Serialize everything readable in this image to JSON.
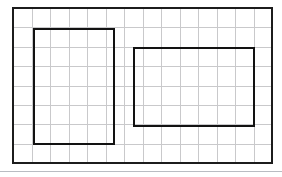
{
  "figure": {
    "background_color": "#ffffff"
  },
  "chart_data": {
    "type": "diagram",
    "subtitle": "",
    "xlabel": "",
    "ylabel": "",
    "grid": true,
    "legend": null,
    "annotations": [],
    "grid_spec": {
      "columns": 14,
      "rows": 8,
      "origin_x_px": 13,
      "origin_y_px": 8,
      "width_px": 259,
      "height_px": 155,
      "cell_width_px": 18.5,
      "cell_height_px": 19.375,
      "minor_line_color": "#c9c9cb",
      "minor_line_width_px": 1,
      "frame_color": "#1c1c1c",
      "frame_line_width_px": 2
    },
    "shapes": [
      {
        "name": "left-rectangle",
        "type": "rectangle",
        "stroke_color": "#121212",
        "stroke_width_px": 2.4,
        "fill": "none",
        "x_px": 34,
        "y_px": 29,
        "width_px": 80,
        "height_px": 115,
        "grid_col_start": 1,
        "grid_col_end": 5,
        "grid_row_start": 1,
        "grid_row_end": 7,
        "width_cells": 4,
        "height_cells": 6,
        "area_cells": 24,
        "perimeter_cells": 20
      },
      {
        "name": "right-rectangle",
        "type": "rectangle",
        "stroke_color": "#121212",
        "stroke_width_px": 2.4,
        "fill": "none",
        "x_px": 134,
        "y_px": 48,
        "width_px": 120,
        "height_px": 78,
        "grid_col_start": 6,
        "grid_col_end": 13,
        "grid_row_start": 2,
        "grid_row_end": 6,
        "width_cells": 6.5,
        "height_cells": 4,
        "area_cells": 26,
        "perimeter_cells": 21
      }
    ],
    "footer_rule": {
      "y_px": 171,
      "x_start_px": 0,
      "x_end_px": 282,
      "color": "#b9bcc2",
      "line_width_px": 1
    }
  }
}
